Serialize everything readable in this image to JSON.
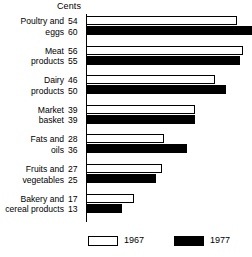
{
  "chart": {
    "type": "bar",
    "orientation": "horizontal",
    "axis_title": "Cents"
  },
  "legend": {
    "position": "bottom",
    "entries": [
      {
        "label": "1967",
        "swatch": "open-rectangle-icon",
        "style": "open"
      },
      {
        "label": "1977",
        "swatch": "filled-rectangle-icon",
        "style": "filled"
      }
    ]
  },
  "chart_data": {
    "type": "bar",
    "title": "",
    "subtitle": "",
    "xlabel": "Cents",
    "ylabel": "",
    "orientation": "horizontal",
    "grid": false,
    "legend_position": "bottom",
    "xlim": [
      0,
      60
    ],
    "categories": [
      "Poultry and eggs",
      "Meat products",
      "Dairy products",
      "Market basket",
      "Fats and oils",
      "Fruits and vegetables",
      "Bakery and cereal products"
    ],
    "series": [
      {
        "name": "1967",
        "values": [
          54,
          56,
          46,
          39,
          28,
          27,
          17
        ]
      },
      {
        "name": "1977",
        "values": [
          60,
          55,
          50,
          39,
          36,
          25,
          13
        ]
      }
    ]
  },
  "groups": [
    {
      "label": "Poultry and\neggs",
      "v1967": 54,
      "v1977": 60,
      "v1967_text": "54",
      "v1977_text": "60"
    },
    {
      "label": "Meat\nproducts",
      "v1967": 56,
      "v1977": 55,
      "v1967_text": "56",
      "v1977_text": "55"
    },
    {
      "label": "Dairy\nproducts",
      "v1967": 46,
      "v1977": 50,
      "v1967_text": "46",
      "v1977_text": "50"
    },
    {
      "label": "Market\nbasket",
      "v1967": 39,
      "v1977": 39,
      "v1967_text": "39",
      "v1977_text": "39"
    },
    {
      "label": "Fats and\noils",
      "v1967": 28,
      "v1977": 36,
      "v1967_text": "28",
      "v1977_text": "36"
    },
    {
      "label": "Fruits and\nvegetables",
      "v1967": 27,
      "v1977": 25,
      "v1967_text": "27",
      "v1977_text": "25"
    },
    {
      "label": "Bakery and\ncereal products",
      "v1967": 17,
      "v1977": 13,
      "v1967_text": "17",
      "v1977_text": "13"
    }
  ]
}
